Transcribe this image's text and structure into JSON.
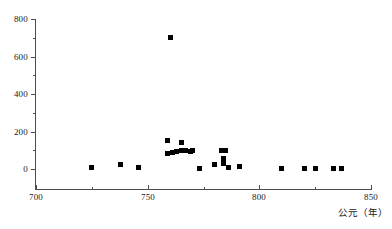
{
  "chart_data": {
    "type": "scatter",
    "title": "",
    "subtitle": "",
    "xlabel": "公元（年）",
    "ylabel": "",
    "xlim": [
      700,
      850
    ],
    "ylim": [
      0,
      800
    ],
    "grid": false,
    "legend": null,
    "marker_style": "filled-square",
    "marker_color": "#000000",
    "x_ticks": [
      700,
      750,
      800,
      850
    ],
    "x_minor_ticks": [
      725,
      775,
      825
    ],
    "y_ticks": [
      0,
      200,
      400,
      600,
      800
    ],
    "y_minor_ticks": [
      100,
      300,
      500,
      700
    ],
    "x_tick_labels": [
      "700",
      "750",
      "800",
      "850"
    ],
    "y_tick_labels": [
      "0",
      "200",
      "400",
      "600",
      "800"
    ],
    "points": [
      {
        "x": 725,
        "y": 10
      },
      {
        "x": 738,
        "y": 22
      },
      {
        "x": 746,
        "y": 6
      },
      {
        "x": 760,
        "y": 700
      },
      {
        "x": 759,
        "y": 150
      },
      {
        "x": 759,
        "y": 85
      },
      {
        "x": 761,
        "y": 90
      },
      {
        "x": 763,
        "y": 92
      },
      {
        "x": 765,
        "y": 140
      },
      {
        "x": 765,
        "y": 100
      },
      {
        "x": 767,
        "y": 100
      },
      {
        "x": 769,
        "y": 95
      },
      {
        "x": 770,
        "y": 100
      },
      {
        "x": 773,
        "y": 5
      },
      {
        "x": 780,
        "y": 22
      },
      {
        "x": 783,
        "y": 100
      },
      {
        "x": 785,
        "y": 100
      },
      {
        "x": 784,
        "y": 55
      },
      {
        "x": 784,
        "y": 30
      },
      {
        "x": 786,
        "y": 10
      },
      {
        "x": 791,
        "y": 12
      },
      {
        "x": 810,
        "y": 2
      },
      {
        "x": 820,
        "y": 2
      },
      {
        "x": 825,
        "y": 2
      },
      {
        "x": 833,
        "y": 2
      },
      {
        "x": 837,
        "y": 2
      }
    ]
  }
}
